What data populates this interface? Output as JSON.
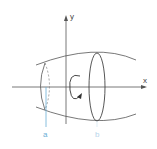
{
  "diagram": {
    "type": "solid-of-revolution",
    "axes": {
      "x_label": "x",
      "y_label": "y"
    },
    "bounds": {
      "left_label": "a",
      "right_label": "b"
    },
    "rotation": "about x-axis",
    "colors": {
      "line": "#444444",
      "bound_line": "#6aaed6",
      "label": "#6aaed6"
    }
  }
}
